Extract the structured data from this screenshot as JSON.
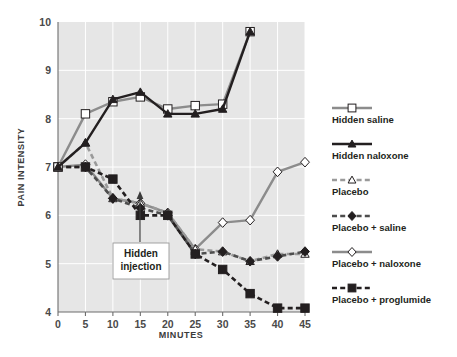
{
  "chart_data": {
    "type": "line",
    "title": "",
    "xlabel": "MINUTES",
    "ylabel": "PAIN INTENSITY",
    "x": [
      0,
      5,
      10,
      15,
      20,
      25,
      30,
      35,
      40,
      45
    ],
    "xticks": [
      "0",
      "5",
      "10",
      "15",
      "20",
      "25",
      "30",
      "35",
      "40",
      "45"
    ],
    "yticks": [
      "10",
      "9",
      "8",
      "7",
      "6",
      "5",
      "4"
    ],
    "xlim": [
      0,
      45
    ],
    "ylim": [
      4,
      10
    ],
    "grid": true,
    "legend_position": "right",
    "annotations": [
      {
        "label_line1": "Hidden",
        "label_line2": "injection",
        "x": 15,
        "y": 6.0
      }
    ],
    "series": [
      {
        "name": "Hidden saline",
        "color": "#8c8c8c",
        "line_style": "solid",
        "marker": "open-square",
        "x": [
          0,
          5,
          10,
          15,
          20,
          25,
          30,
          35
        ],
        "values": [
          7.0,
          8.1,
          8.35,
          8.45,
          8.2,
          8.27,
          8.3,
          9.8
        ]
      },
      {
        "name": "Hidden naloxone",
        "color": "#231f20",
        "line_style": "solid",
        "marker": "filled-triangle",
        "x": [
          0,
          5,
          10,
          15,
          20,
          25,
          30,
          35
        ],
        "values": [
          7.0,
          7.5,
          8.4,
          8.55,
          8.1,
          8.1,
          8.2,
          9.8
        ]
      },
      {
        "name": "Placebo",
        "color": "#9a9a9a",
        "line_style": "dashed",
        "marker": "open-triangle",
        "x": [
          0,
          5,
          10,
          15,
          20,
          25,
          30,
          35,
          40,
          45
        ],
        "values": [
          7.0,
          7.5,
          6.35,
          6.25,
          6.05,
          5.3,
          5.25,
          5.05,
          5.2,
          5.2
        ]
      },
      {
        "name": "Placebo + saline",
        "color": "#4d4d4d",
        "line_style": "dashed",
        "marker": "filled-diamond",
        "x": [
          0,
          5,
          10,
          15,
          20,
          25,
          30,
          35,
          40,
          45
        ],
        "values": [
          7.0,
          7.0,
          6.35,
          6.15,
          6.0,
          5.2,
          5.25,
          5.05,
          5.15,
          5.25
        ]
      },
      {
        "name": "Placebo + naloxone",
        "color": "#8c8c8c",
        "line_style": "solid",
        "marker": "open-diamond",
        "x": [
          0,
          5,
          10,
          15,
          20,
          25,
          30,
          35,
          40,
          45
        ],
        "values": [
          7.0,
          7.05,
          6.35,
          6.25,
          6.05,
          5.3,
          5.85,
          5.9,
          6.9,
          7.1
        ]
      },
      {
        "name": "Placebo + proglumide",
        "color": "#231f20",
        "line_style": "dashed",
        "marker": "filled-square",
        "x": [
          0,
          5,
          10,
          15,
          20,
          25,
          30,
          35,
          40,
          45
        ],
        "values": [
          7.0,
          7.0,
          6.75,
          6.0,
          6.0,
          5.2,
          4.88,
          4.38,
          4.08,
          4.08
        ]
      }
    ]
  },
  "legend": {
    "items": [
      {
        "label": "Hidden saline"
      },
      {
        "label": "Hidden naloxone"
      },
      {
        "label": "Placebo"
      },
      {
        "label": "Placebo + saline"
      },
      {
        "label": "Placebo + naloxone"
      },
      {
        "label": "Placebo + proglumide"
      }
    ]
  }
}
